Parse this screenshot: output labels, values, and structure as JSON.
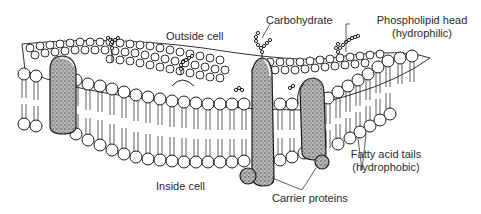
{
  "diagram": {
    "regions": {
      "outside": "Outside cell",
      "inside": "Inside cell"
    },
    "labels": {
      "carbohydrate": "Carbohydrate",
      "phospholipid_head_line1": "Phospholipid head",
      "phospholipid_head_line2": "(hydrophilic)",
      "fatty_acid_line1": "Fatty acid tails",
      "fatty_acid_line2": "(hydrophobic)",
      "carrier_proteins": "Carrier proteins"
    },
    "components": [
      {
        "name": "phospholipid-bilayer",
        "description": "Two layers of circular heads with line tails"
      },
      {
        "name": "integral-protein-left",
        "description": "Stippled rounded protein spanning bilayer"
      },
      {
        "name": "carrier-protein-tall",
        "description": "Tall stippled protein with carbohydrate chain"
      },
      {
        "name": "carrier-protein-short",
        "description": "Second stippled protein with bulb below"
      },
      {
        "name": "carbohydrate-chains",
        "description": "Beaded branched chains on outer surface"
      }
    ],
    "colors": {
      "ink": "#1a1a1a",
      "protein_fill": "#9a9a9a",
      "background": "#ffffff"
    }
  }
}
